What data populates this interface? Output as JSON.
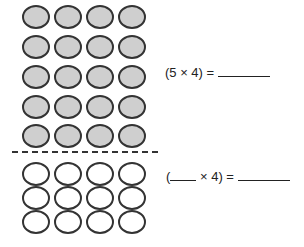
{
  "figure": {
    "top_group": {
      "rows": 5,
      "cols": 4,
      "fill": "#cfcfcf",
      "label": "filled circles"
    },
    "bottom_group": {
      "rows": 3,
      "cols": 4,
      "fill": "#ffffff",
      "label": "empty circles"
    },
    "divider": "dashed line"
  },
  "equations": [
    {
      "prefix": "(5 × 4) =",
      "answer_blank": ""
    },
    {
      "open": "(",
      "first_blank": "",
      "middle": " × 4) =",
      "answer_blank": ""
    }
  ]
}
